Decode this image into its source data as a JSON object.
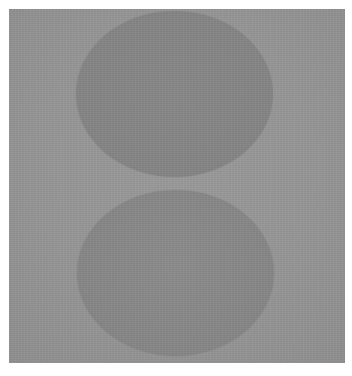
{
  "image": {
    "subject": "two stacked muted gray circles on a gray field",
    "colors": {
      "page_background": "#ffffff",
      "field": "#979797",
      "circle_top": "#868686",
      "circle_bottom": "#878787"
    },
    "shapes": [
      {
        "name": "top-circle",
        "cx": 175,
        "cy": 94,
        "rx": 98,
        "ry": 83
      },
      {
        "name": "bottom-circle",
        "cx": 176,
        "cy": 273,
        "rx": 98,
        "ry": 83
      }
    ]
  }
}
